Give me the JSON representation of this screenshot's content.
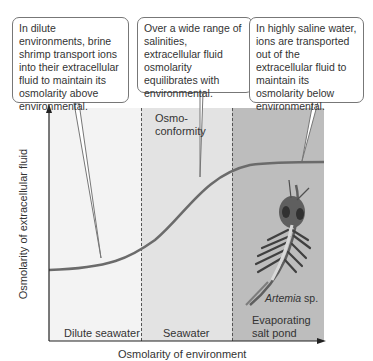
{
  "callouts": [
    {
      "id": "dilute",
      "text": "In dilute environments, brine shrimp transport ions into their extracellular fluid to maintain its osmolarity above environmental."
    },
    {
      "id": "conform",
      "text": "Over a wide range of salinities, extracellular fluid osmolarity equilibrates with environmental."
    },
    {
      "id": "saline",
      "text": "In highly saline water, ions are transported out of the extracellular fluid to maintain its osmolarity below environmental."
    }
  ],
  "regions": [
    {
      "label": "Dilute seawater",
      "color": "#f3f3f3"
    },
    {
      "label": "Seawater",
      "color": "#e3e3e3"
    },
    {
      "label": "Evaporating salt pond",
      "label_line1": "Evaporating",
      "label_line2": "salt pond",
      "color": "#bdbdbd"
    }
  ],
  "annotations": {
    "osmoconformity_line1": "Osmo-",
    "osmoconformity_line2": "conformity",
    "species_genus": "Artemia",
    "species_suffix": " sp."
  },
  "axes": {
    "xlabel": "Osmolarity of environment",
    "ylabel": "Osmolarity of extracellular fluid"
  },
  "colors": {
    "curve": "#6b6b6b",
    "axis": "#222222"
  }
}
